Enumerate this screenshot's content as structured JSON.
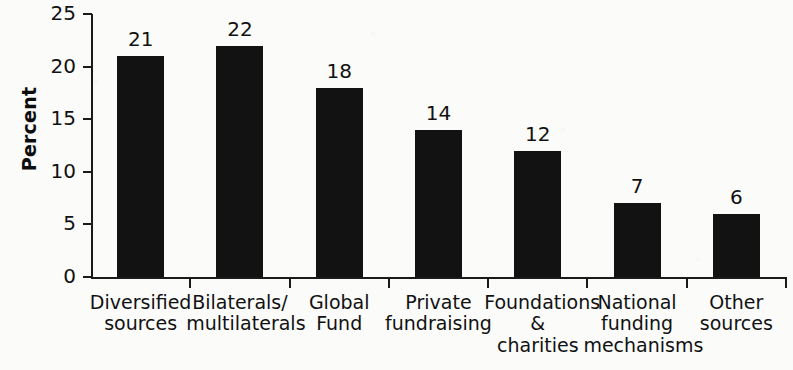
{
  "chart_data": {
    "type": "bar",
    "title": "",
    "xlabel": "",
    "ylabel": "Percent",
    "ylim": [
      0,
      25
    ],
    "yticks": [
      0,
      5,
      10,
      15,
      20,
      25
    ],
    "grid": false,
    "legend": null,
    "categories": [
      "Diversified\nsources",
      "Bilaterals/\nmultilaterals",
      "Global\nFund",
      "Private\nfundraising",
      "Foundations\n&\ncharities",
      "National\nfunding\nmechanisms",
      "Other\nsources"
    ],
    "values": [
      21,
      22,
      18,
      14,
      12,
      7,
      6
    ],
    "value_labels": [
      "21",
      "22",
      "18",
      "14",
      "12",
      "7",
      "6"
    ],
    "bar_color": "#121212",
    "axis_color": "#1a1a1a",
    "background_color": "#fbfbfa"
  },
  "axis": {
    "y_title": "Percent",
    "y_tick_labels": [
      "25",
      "20",
      "15",
      "10",
      "5",
      "0"
    ]
  }
}
